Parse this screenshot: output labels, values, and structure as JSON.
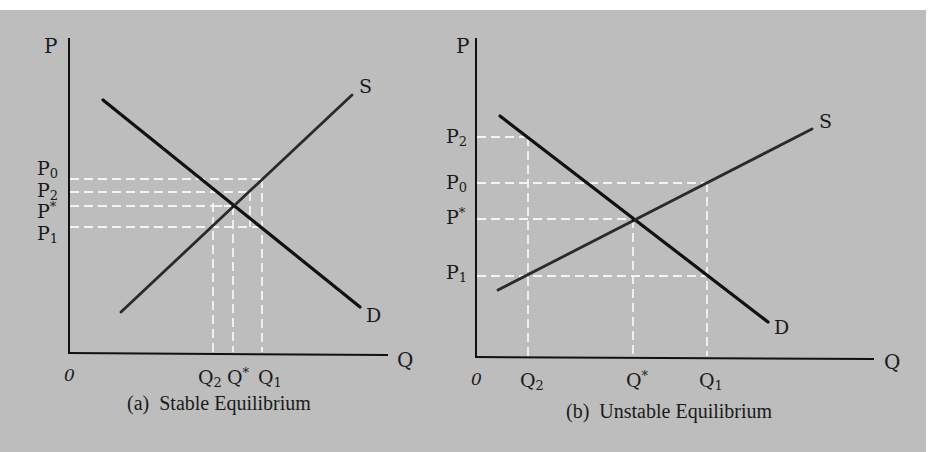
{
  "figure": {
    "background_color": "#bdbdbd",
    "panels": [
      {
        "id": "a",
        "caption": "(a)  Stable Equilibrium",
        "y_axis_label": "P",
        "x_axis_label": "Q",
        "origin_label": "0",
        "curves": {
          "demand_label": "D",
          "supply_label": "S"
        },
        "price_labels": [
          {
            "base": "P",
            "sub": "0",
            "sup": ""
          },
          {
            "base": "P",
            "sub": "2",
            "sup": ""
          },
          {
            "base": "P",
            "sub": "",
            "sup": "*"
          },
          {
            "base": "P",
            "sub": "1",
            "sup": ""
          }
        ],
        "quantity_labels": [
          {
            "base": "Q",
            "sub": "2",
            "sup": ""
          },
          {
            "base": "Q",
            "sub": "",
            "sup": "*"
          },
          {
            "base": "Q",
            "sub": "1",
            "sup": ""
          }
        ]
      },
      {
        "id": "b",
        "caption": "(b)  Unstable Equilibrium",
        "y_axis_label": "P",
        "x_axis_label": "Q",
        "origin_label": "0",
        "curves": {
          "demand_label": "D",
          "supply_label": "S"
        },
        "price_labels": [
          {
            "base": "P",
            "sub": "2",
            "sup": ""
          },
          {
            "base": "P",
            "sub": "0",
            "sup": ""
          },
          {
            "base": "P",
            "sub": "",
            "sup": "*"
          },
          {
            "base": "P",
            "sub": "1",
            "sup": ""
          }
        ],
        "quantity_labels": [
          {
            "base": "Q",
            "sub": "2",
            "sup": ""
          },
          {
            "base": "Q",
            "sub": "",
            "sup": "*"
          },
          {
            "base": "Q",
            "sub": "1",
            "sup": ""
          }
        ]
      }
    ]
  }
}
